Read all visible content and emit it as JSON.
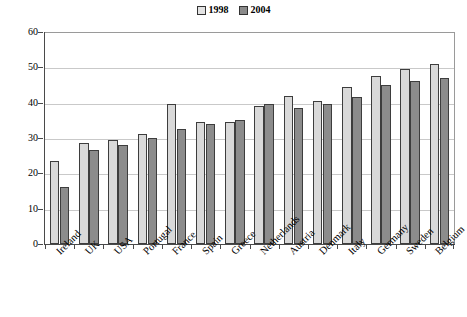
{
  "chart_data": {
    "type": "bar",
    "title": "",
    "subtitle": "",
    "xlabel": "",
    "ylabel": "",
    "ylim": [
      0,
      60
    ],
    "yticks": [
      0,
      10,
      20,
      30,
      40,
      50,
      60
    ],
    "grid": true,
    "legend_position": "top-center",
    "categories": [
      "Ireland",
      "UK",
      "USA",
      "Portugal",
      "France",
      "Spain",
      "Greece",
      "Netherlands",
      "Austria",
      "Denmark",
      "Italy",
      "Germany",
      "Sweden",
      "Belgium"
    ],
    "series": [
      {
        "name": "1998",
        "color": "#d9d9d9",
        "values": [
          23.5,
          28.5,
          29.5,
          31.0,
          39.5,
          34.5,
          34.5,
          39.0,
          42.0,
          40.5,
          44.5,
          47.5,
          49.5,
          51.0
        ]
      },
      {
        "name": "2004",
        "color": "#8c8c8c",
        "values": [
          16.0,
          26.5,
          28.0,
          30.0,
          32.5,
          34.0,
          35.0,
          39.5,
          38.5,
          39.5,
          41.5,
          45.0,
          46.0,
          47.0
        ]
      }
    ],
    "annotations": []
  },
  "legend": {
    "entries": [
      {
        "label": "1998",
        "swatch": "light-gray-square"
      },
      {
        "label": "2004",
        "swatch": "dark-gray-square"
      }
    ]
  },
  "axes": {
    "y_tick_labels": [
      "0",
      "10",
      "20",
      "30",
      "40",
      "50",
      "60"
    ],
    "x_tick_labels": [
      "Ireland",
      "UK",
      "USA",
      "Portugal",
      "France",
      "Spain",
      "Greece",
      "Netherlands",
      "Austria",
      "Denmark",
      "Italy",
      "Germany",
      "Sweden",
      "Belgium"
    ]
  },
  "colors": {
    "series_1998": "#d9d9d9",
    "series_2004": "#8c8c8c",
    "bar_outline": "#3d3d3d",
    "gridline": "#c9c9c9",
    "axis": "#4a4a4a",
    "plot_border": "#9a9a9a",
    "background": "#ffffff",
    "text": "#000000"
  }
}
